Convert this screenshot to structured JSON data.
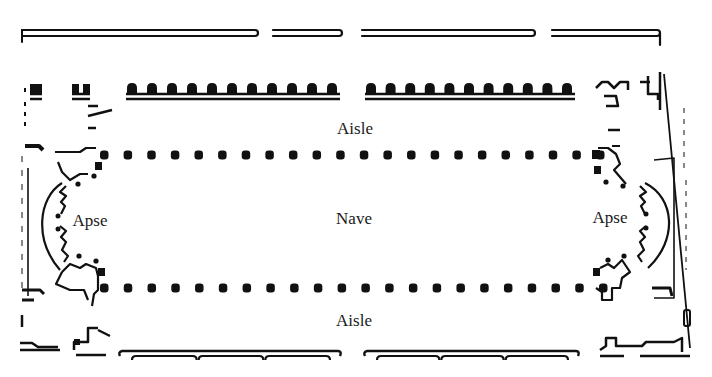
{
  "diagram": {
    "type": "basilica floor plan",
    "ink_color": "#111111",
    "background_color": "#ffffff",
    "labels": {
      "aisle_top": "Aisle",
      "nave": "Nave",
      "aisle_bottom": "Aisle",
      "apse_left": "Apse",
      "apse_right": "Apse"
    },
    "label_positions": {
      "aisle_top": [
        355,
        128
      ],
      "nave": [
        354,
        218
      ],
      "aisle_bottom": [
        354,
        320
      ],
      "apse_left": [
        90,
        220
      ],
      "apse_right": [
        610,
        217
      ]
    },
    "colonnades": {
      "upper": {
        "y": 155,
        "x_start": 104,
        "x_end": 600,
        "count": 22
      },
      "lower": {
        "y": 288,
        "x_start": 104,
        "x_end": 603,
        "count": 22
      }
    },
    "outer_wall_top_segments": [
      [
        22,
        258
      ],
      [
        273,
        342
      ],
      [
        362,
        535
      ],
      [
        552,
        660
      ]
    ],
    "aisle_wall_top_segments": [
      [
        126,
        340
      ],
      [
        365,
        575
      ]
    ],
    "aisle_wall_top_pilasters_per_segment": 11,
    "bottom_wall_segments": [
      [
        120,
        340
      ],
      [
        365,
        578
      ]
    ]
  }
}
